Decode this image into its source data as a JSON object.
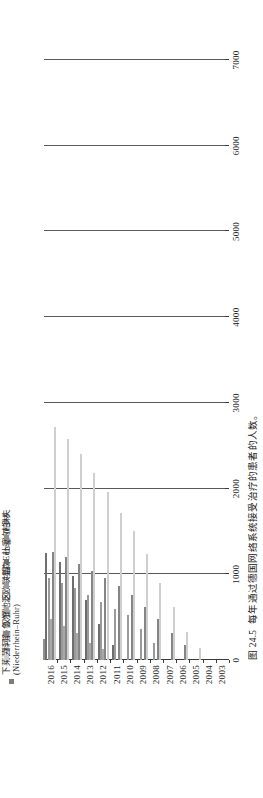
{
  "figure": {
    "caption_number": "图 24.5",
    "caption_text": "每年通过德国网络系统接受治疗的患者的人数。"
  },
  "legend": {
    "items": [
      {
        "label": "柏林",
        "color": "#8f8f8f"
      },
      {
        "label": "杜塞尔多夫",
        "color": "#6e6e6e"
      },
      {
        "label": "埃森",
        "color": "#9a9a9a"
      },
      {
        "label": "泛欧联盟 (Euregio)",
        "color": "#a8a8a8"
      },
      {
        "label": "汉堡",
        "color": "#858585"
      },
      {
        "label": "科隆",
        "color": "#cfcfcf"
      },
      {
        "label": "下莱茵河与鲁尔地区\n(Niederrhein–Ruhr)",
        "color": "#7d7d7d"
      }
    ]
  },
  "axes": {
    "value_ticks": [
      0,
      1000,
      2000,
      3000,
      4000,
      5000,
      6000,
      7000
    ],
    "value_min": 0,
    "value_max": 7000,
    "year_ticks": [
      2003,
      2004,
      2005,
      2006,
      2007,
      2008,
      2009,
      2010,
      2011,
      2012,
      2013,
      2014,
      2015,
      2016
    ]
  },
  "chart_data": {
    "type": "bar",
    "orientation": "horizontal",
    "title": "每年通过德国网络系统接受治疗的患者的人数。",
    "xlabel": "",
    "ylabel": "",
    "xlim": [
      0,
      7000
    ],
    "grid": true,
    "legend_position": "top",
    "categories": [
      2003,
      2004,
      2005,
      2006,
      2007,
      2008,
      2009,
      2010,
      2011,
      2012,
      2013,
      2014,
      2015,
      2016
    ],
    "series": [
      {
        "name": "柏林",
        "color": "#8f8f8f",
        "values": [
          0,
          0,
          0,
          0,
          0,
          0,
          0,
          0,
          0,
          0,
          0,
          0,
          0,
          240
        ]
      },
      {
        "name": "杜塞尔多夫",
        "color": "#6e6e6e",
        "values": [
          0,
          0,
          0,
          0,
          0,
          0,
          0,
          0,
          170,
          420,
          700,
          980,
          1140,
          1250
        ]
      },
      {
        "name": "埃森",
        "color": "#9a9a9a",
        "values": [
          0,
          0,
          0,
          0,
          0,
          200,
          360,
          520,
          600,
          680,
          760,
          840,
          900,
          960
        ]
      },
      {
        "name": "泛欧联盟 (Euregio)",
        "color": "#a8a8a8",
        "values": [
          0,
          0,
          0,
          0,
          0,
          0,
          0,
          0,
          0,
          130,
          200,
          310,
          400,
          480
        ]
      },
      {
        "name": "汉堡",
        "color": "#858585",
        "values": [
          0,
          0,
          0,
          170,
          320,
          480,
          620,
          760,
          860,
          960,
          1040,
          1120,
          1200,
          1260
        ]
      },
      {
        "name": "科隆",
        "color": "#cfcfcf",
        "values": [
          0,
          0,
          140,
          330,
          620,
          900,
          1240,
          1500,
          1720,
          1960,
          2180,
          2400,
          2580,
          2720
        ]
      },
      {
        "name": "下莱茵河与鲁尔地区 (Niederrhein–Ruhr)",
        "color": "#7d7d7d",
        "values": [
          0,
          0,
          0,
          0,
          0,
          0,
          0,
          0,
          0,
          0,
          0,
          0,
          0,
          0
        ]
      }
    ]
  }
}
